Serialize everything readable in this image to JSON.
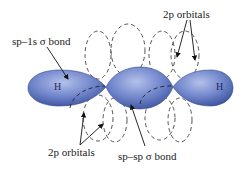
{
  "diagram": {
    "labels": {
      "top_left": "sp–1s σ bond",
      "top_right": "2p orbitals",
      "bottom_left": "2p orbitals",
      "bottom_center": "sp–sp σ bond"
    },
    "atoms": {
      "left_h": "H",
      "right_h": "H"
    },
    "colors": {
      "lobe_fill": "#6f85c8",
      "lobe_dark": "#3d55a0",
      "dashed": "#555555"
    }
  }
}
